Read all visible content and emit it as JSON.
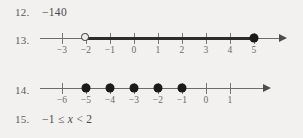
{
  "page": {
    "background_color": "#f2f1f0",
    "ink_color": "#4a4a4a"
  },
  "items": [
    {
      "number": "12.",
      "type": "text",
      "text": "−140"
    },
    {
      "number": "13.",
      "type": "numberline",
      "line": {
        "tick_labels": [
          "−3",
          "−2",
          "−1",
          "0",
          "1",
          "2",
          "3",
          "4",
          "5"
        ],
        "tick_values": [
          -3,
          -2,
          -1,
          0,
          1,
          2,
          3,
          4,
          5
        ],
        "axis_min": -3.9,
        "axis_max": 6.1,
        "spacing_px": 24,
        "arrow_right": true,
        "arrow_left": false,
        "segments": [
          {
            "from": -2,
            "to": 5,
            "style": "thick"
          }
        ],
        "points": [
          {
            "value": -2,
            "style": "open"
          },
          {
            "value": 5,
            "style": "closed"
          }
        ]
      }
    },
    {
      "number": "14.",
      "type": "numberline",
      "line": {
        "tick_labels": [
          "−6",
          "−5",
          "−4",
          "−3",
          "−2",
          "−1",
          "0",
          "1"
        ],
        "tick_values": [
          -6,
          -5,
          -4,
          -3,
          -2,
          -1,
          0,
          1
        ],
        "axis_min": -6.9,
        "axis_max": 2.4,
        "spacing_px": 24,
        "arrow_right": true,
        "arrow_left": false,
        "segments": [],
        "points": [
          {
            "value": -5,
            "style": "closed"
          },
          {
            "value": -4,
            "style": "closed"
          },
          {
            "value": -3,
            "style": "closed"
          },
          {
            "value": -2,
            "style": "closed"
          },
          {
            "value": -1,
            "style": "closed"
          }
        ]
      }
    },
    {
      "number": "15.",
      "type": "text",
      "text_parts": [
        {
          "t": "−1 ≤ ",
          "italic": false
        },
        {
          "t": "x",
          "italic": true
        },
        {
          "t": " < 2",
          "italic": false
        }
      ],
      "text": "−1 ≤ x < 2"
    }
  ],
  "layout": {
    "row_tops": [
      6,
      28,
      78,
      113
    ],
    "origin_x": 62,
    "tick_origin_value": [
      -3,
      -6
    ]
  }
}
